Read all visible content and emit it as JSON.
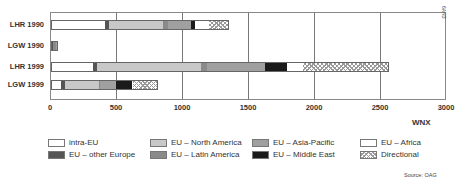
{
  "chart_data": {
    "type": "bar",
    "orientation": "horizontal",
    "stacked": true,
    "title": "",
    "xlabel": "WNX",
    "ylabel": "",
    "xlim": [
      0,
      3000
    ],
    "xticks": [
      "0",
      "500",
      "1000",
      "1500",
      "2000",
      "2500",
      "3000"
    ],
    "grid": true,
    "legend_position": "bottom",
    "categories": [
      "LHR 1990",
      "LGW 1990",
      "LHR 1999",
      "LGW 1999"
    ],
    "series": [
      {
        "name": "intra-EU",
        "color": "#ffffff",
        "values": [
          410,
          0,
          320,
          75
        ]
      },
      {
        "name": "EU - other Europe",
        "color": "#555555",
        "values": [
          30,
          15,
          30,
          30
        ]
      },
      {
        "name": "EU - North America",
        "color": "#c8c8c8",
        "values": [
          410,
          0,
          790,
          260
        ]
      },
      {
        "name": "EU - Latin America",
        "color": "#8a8a8a",
        "values": [
          40,
          20,
          40,
          5
        ]
      },
      {
        "name": "EU - Asia-Pacific",
        "color": "#a0a0a0",
        "values": [
          170,
          10,
          440,
          125
        ]
      },
      {
        "name": "EU - Middle East",
        "color": "#1a1a1a",
        "values": [
          30,
          0,
          170,
          120
        ]
      },
      {
        "name": "EU - Africa",
        "color": "#ffffff",
        "values": [
          110,
          0,
          120,
          10
        ]
      },
      {
        "name": "Directional",
        "color": "hatch",
        "values": [
          150,
          5,
          650,
          185
        ]
      }
    ]
  },
  "legend": [
    {
      "label": "intra-EU"
    },
    {
      "label": "EU – North America"
    },
    {
      "label": "EU – Asia-Pacific"
    },
    {
      "label": "EU – Africa"
    },
    {
      "label": "EU – other Europe"
    },
    {
      "label": "EU – Latin America"
    },
    {
      "label": "EU – Middle East"
    },
    {
      "label": "Directional"
    }
  ],
  "source": "Source: OAG",
  "corner_tag": "6AN3"
}
